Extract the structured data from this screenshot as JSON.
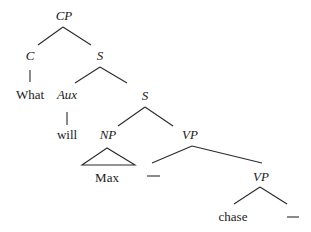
{
  "tree": {
    "nodes": {
      "cp": {
        "label": "CP",
        "type": "category"
      },
      "c": {
        "label": "C",
        "type": "category"
      },
      "what": {
        "label": "What",
        "type": "word"
      },
      "s1": {
        "label": "S",
        "type": "category"
      },
      "aux": {
        "label": "Aux",
        "type": "category"
      },
      "will": {
        "label": "will",
        "type": "word"
      },
      "s2": {
        "label": "S",
        "type": "category"
      },
      "np": {
        "label": "NP",
        "type": "category"
      },
      "max": {
        "label": "Max",
        "type": "word"
      },
      "gap1": {
        "label": "—",
        "type": "trace"
      },
      "vp1": {
        "label": "VP",
        "type": "category"
      },
      "vp2": {
        "label": "VP",
        "type": "category"
      },
      "chase": {
        "label": "chase",
        "type": "word"
      },
      "gap2": {
        "label": "—",
        "type": "trace"
      }
    },
    "edges": [
      [
        "cp",
        "c"
      ],
      [
        "cp",
        "s1"
      ],
      [
        "c",
        "what"
      ],
      [
        "s1",
        "aux"
      ],
      [
        "s1",
        "s2"
      ],
      [
        "aux",
        "will"
      ],
      [
        "s2",
        "np"
      ],
      [
        "s2",
        "vp1"
      ],
      [
        "np",
        "max"
      ],
      [
        "vp1",
        "gap1"
      ],
      [
        "vp1",
        "vp2"
      ],
      [
        "vp2",
        "chase"
      ],
      [
        "vp2",
        "gap2"
      ]
    ]
  }
}
